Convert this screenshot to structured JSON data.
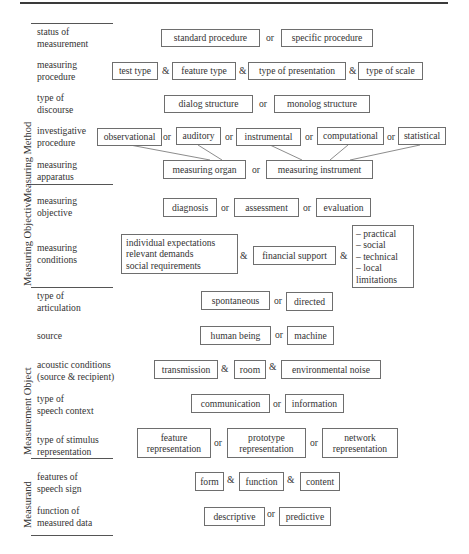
{
  "categories": {
    "method": "Measuring Method",
    "objective": "Measuring Objective",
    "object": "Measurement Object",
    "measurand": "Measurand"
  },
  "rows": {
    "status": {
      "label": "status of\nmeasurement",
      "options": [
        "standard procedure",
        "specific procedure"
      ],
      "ops": [
        "or"
      ]
    },
    "procedure": {
      "label": "measuring\nprocedure",
      "options": [
        "test type",
        "feature type",
        "type of presentation",
        "type of scale"
      ],
      "ops": [
        "&",
        "&",
        "&"
      ]
    },
    "discourse": {
      "label": "type of\ndiscourse",
      "options": [
        "dialog structure",
        "monolog structure"
      ],
      "ops": [
        "or"
      ]
    },
    "investigative": {
      "label": "investigative\nprocedure",
      "options": [
        "observational",
        "auditory",
        "instrumental",
        "computational",
        "statistical"
      ],
      "ops": [
        "or",
        "or",
        "or",
        "or"
      ]
    },
    "apparatus": {
      "label": "measuring\napparatus",
      "options": [
        "measuring organ",
        "measuring instrument"
      ],
      "ops": [
        "or"
      ]
    },
    "objective": {
      "label": "measuring\nobjective",
      "options": [
        "diagnosis",
        "assessment",
        "evaluation"
      ],
      "ops": [
        "or",
        "or"
      ]
    },
    "conditions": {
      "label": "measuring\nconditions",
      "options": [
        "individual expectations\nrelevant demands\nsocial requirements",
        "financial support",
        "– practical\n– social\n– technical\n– local\nlimitations"
      ],
      "ops": [
        "&",
        "&"
      ]
    },
    "articulation": {
      "label": "type of\narticulation",
      "options": [
        "spontaneous",
        "directed"
      ],
      "ops": [
        "or"
      ]
    },
    "source": {
      "label": "source",
      "options": [
        "human being",
        "machine"
      ],
      "ops": [
        "or"
      ]
    },
    "acoustic": {
      "label": "acoustic conditions\n(source & recipient)",
      "options": [
        "transmission",
        "room",
        "environmental noise"
      ],
      "ops": [
        "&",
        "&"
      ]
    },
    "context": {
      "label": "type of\nspeech context",
      "options": [
        "communication",
        "information"
      ],
      "ops": [
        "or"
      ]
    },
    "stimulus": {
      "label": "type of stimulus\nrepresentation",
      "options": [
        "feature\nrepresentation",
        "prototype\nrepresentation",
        "network\nrepresentation"
      ],
      "ops": [
        "or",
        "or"
      ]
    },
    "features": {
      "label": "features of\nspeech sign",
      "options": [
        "form",
        "function",
        "content"
      ],
      "ops": [
        "&",
        "&"
      ]
    },
    "function": {
      "label": "function of\nmeasured data",
      "options": [
        "descriptive",
        "predictive"
      ],
      "ops": [
        "or"
      ]
    }
  }
}
